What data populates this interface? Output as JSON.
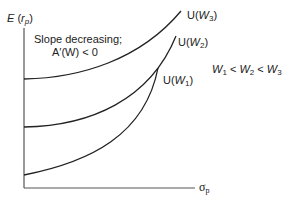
{
  "diagram": {
    "y_axis_label": {
      "main": "E",
      "paren_open": " (",
      "var": "r",
      "sub": "p",
      "paren_close": ")"
    },
    "x_axis_label": {
      "main": "σ",
      "sub": "p"
    },
    "annotation": {
      "line1": "Slope decreasing;",
      "line2": "A′(W) < 0"
    },
    "curves": [
      {
        "label_prefix": "U(",
        "var": "W",
        "sub": "3",
        "suffix": ")"
      },
      {
        "label_prefix": "U(",
        "var": "W",
        "sub": "2",
        "suffix": ")"
      },
      {
        "label_prefix": "U(",
        "var": "W",
        "sub": "1",
        "suffix": ")"
      }
    ],
    "inequality": {
      "w": "W",
      "s1": "1",
      "s2": "2",
      "s3": "3",
      "lt": " < "
    },
    "colors": {
      "axis": "#555555",
      "curve": "#222222"
    }
  }
}
